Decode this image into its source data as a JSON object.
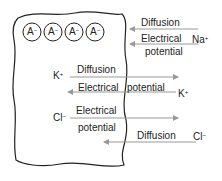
{
  "diagram": {
    "cell": {
      "anions": [
        {
          "label": "A",
          "charge": "−"
        },
        {
          "label": "A",
          "charge": "−"
        },
        {
          "label": "A",
          "charge": "−"
        },
        {
          "label": "A",
          "charge": "−"
        }
      ]
    },
    "ions": {
      "na": {
        "symbol": "Na",
        "charge": "+"
      },
      "k_in": {
        "symbol": "K",
        "charge": "+"
      },
      "k_out": {
        "symbol": "K",
        "charge": "+"
      },
      "cl_in": {
        "symbol": "Cl",
        "charge": "−"
      },
      "cl_out": {
        "symbol": "Cl",
        "charge": "−"
      }
    },
    "forces": {
      "na_diffusion": "Diffusion",
      "na_electrical_1": "Electrical",
      "na_electrical_2": "potential",
      "k_diffusion": "Diffusion",
      "k_electrical_1": "Electrical",
      "k_electrical_2": "potential",
      "cl_electrical_1": "Electrical",
      "cl_electrical_2": "potential",
      "cl_diffusion": "Diffusion"
    },
    "colors": {
      "arrow": "#999999",
      "outline": "#222222"
    }
  }
}
